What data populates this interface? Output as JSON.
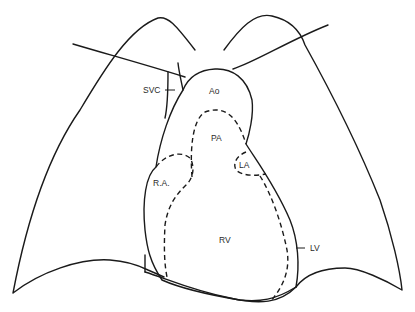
{
  "diagram": {
    "type": "anatomical line drawing - chest / heart frontal view",
    "labels": {
      "svc": "SVC",
      "ao": "Ao",
      "pa": "PA",
      "la": "LA",
      "ra": "R.A.",
      "rv": "RV",
      "lv": "LV"
    },
    "colors": {
      "line": "#1a1a1a",
      "background": "#ffffff"
    }
  }
}
